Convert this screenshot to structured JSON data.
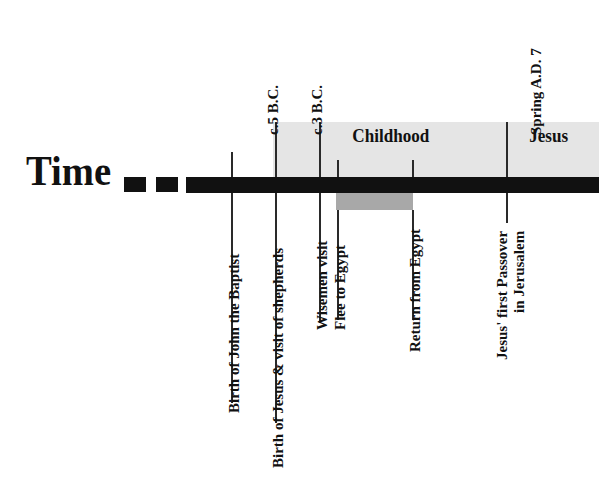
{
  "figure": {
    "title_word": "Time",
    "colors": {
      "ink": "#111111",
      "band_light": "#e5e5e5",
      "band_dark": "#a8a8a8",
      "bar": "#111111"
    }
  },
  "era_bands": [
    {
      "label": "Childhood",
      "start_x": 273,
      "end_x": 507
    },
    {
      "label": "Jesus",
      "start_x": 507,
      "end_x": 599
    }
  ],
  "date_labels": [
    {
      "text": "c.5 B.C.",
      "x": 276
    },
    {
      "text": "c.3 B.C.",
      "x": 320
    },
    {
      "text": "Spring A.D. 7",
      "x": 507
    }
  ],
  "events": [
    {
      "line1": "Birth of John the Baptist",
      "line2": "",
      "x": 232
    },
    {
      "line1": "Birth of Jesus & visit of shepherds",
      "line2": "",
      "x": 276
    },
    {
      "line1": "Wisemen visit",
      "line2": "",
      "x": 320
    },
    {
      "line1": "Flee to Egypt",
      "line2": "",
      "x": 338
    },
    {
      "line1": "Return from Egypt",
      "line2": "",
      "x": 413
    },
    {
      "line1": "Jesus' first Passover",
      "line2": "in Jerusalem",
      "x": 507
    }
  ],
  "periods": [
    {
      "name": "Sojourn in Egypt",
      "start_x": 336,
      "end_x": 413
    }
  ]
}
